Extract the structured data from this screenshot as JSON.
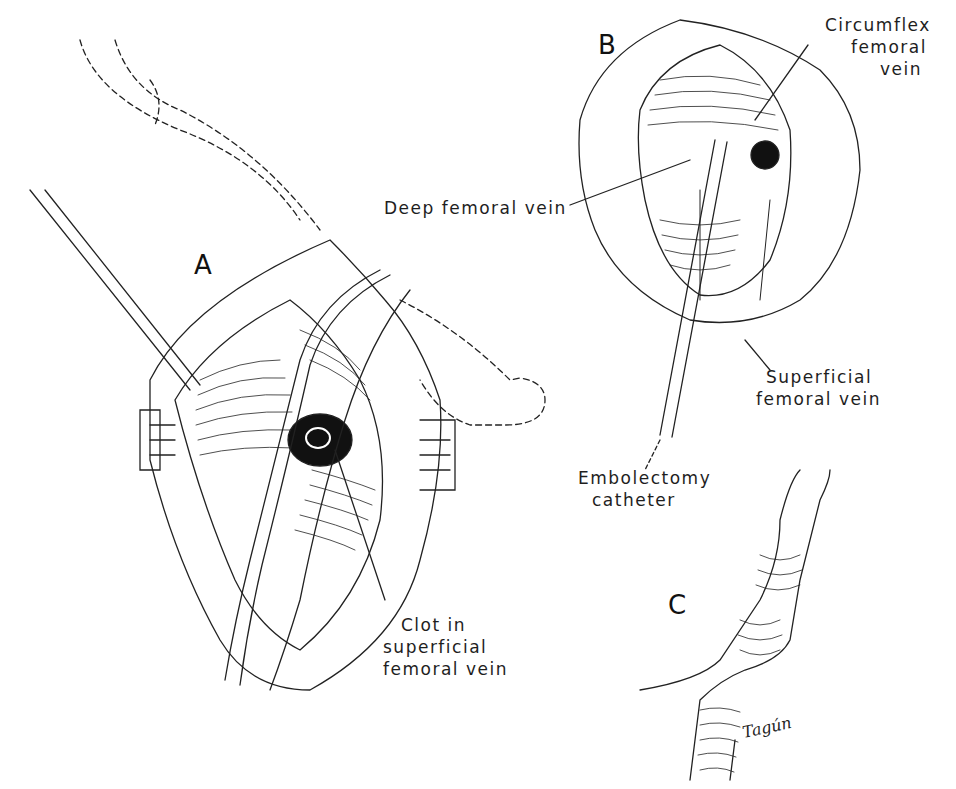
{
  "figure": {
    "panels": [
      {
        "id": "A",
        "letter": "A"
      },
      {
        "id": "B",
        "letter": "B"
      },
      {
        "id": "C",
        "letter": "C"
      }
    ],
    "labels": {
      "circumflex": [
        "Circumflex",
        "femoral",
        "vein"
      ],
      "deep_femoral": "Deep femoral vein",
      "superficial_b": [
        "Superficial",
        "femoral vein"
      ],
      "catheter": [
        "Embolectomy",
        "catheter"
      ],
      "clot": [
        "Clot in",
        "superficial",
        "femoral vein"
      ]
    },
    "signature": "Tagún",
    "colors": {
      "ink": "#1a1a1a",
      "background": "#ffffff"
    }
  }
}
